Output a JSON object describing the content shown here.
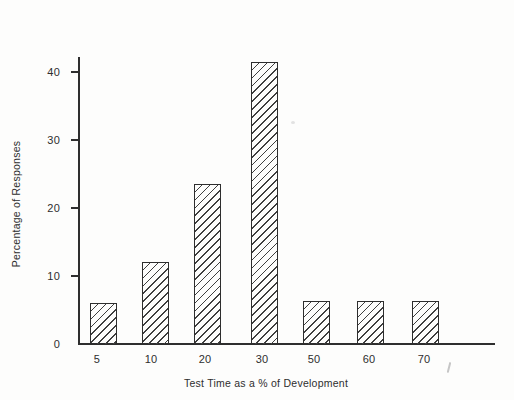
{
  "figure": {
    "paper_color": "#fdfdfc",
    "ink_color": "#2e2e2e",
    "hatch_color": "#3f3f3f"
  },
  "chart_data": {
    "type": "bar",
    "title": "",
    "xlabel": "Test Time as a % of Development",
    "ylabel": "Percentage of Responses",
    "categories": [
      "5",
      "10",
      "20",
      "30",
      "50",
      "60",
      "70"
    ],
    "values": [
      6,
      12,
      23.5,
      41.5,
      6.2,
      6.2,
      6.2
    ],
    "y_ticks": [
      0,
      10,
      20,
      30,
      40
    ],
    "ylim": [
      0,
      42
    ],
    "grid": false,
    "legend_position": "none",
    "bar_style": "diagonal-hatch-outline"
  }
}
